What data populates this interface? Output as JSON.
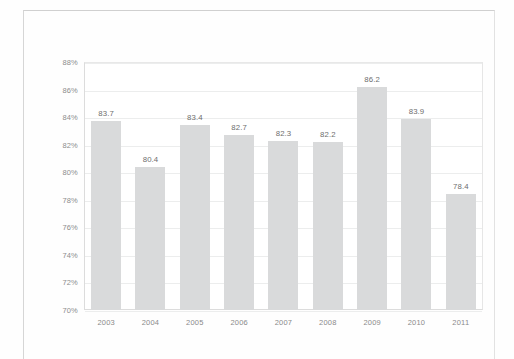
{
  "chart_data": {
    "type": "bar",
    "title": "",
    "subtitle": "",
    "xlabel": "",
    "ylabel": "",
    "categories": [
      "2003",
      "2004",
      "2005",
      "2006",
      "2007",
      "2008",
      "2009",
      "2010",
      "2011"
    ],
    "values": [
      83.7,
      80.4,
      83.4,
      82.7,
      82.3,
      82.2,
      86.2,
      83.9,
      78.4
    ],
    "value_labels": [
      "83.7",
      "80.4",
      "83.4",
      "82.7",
      "82.3",
      "82.2",
      "86.2",
      "83.9",
      "78.4"
    ],
    "ylim": [
      70,
      88
    ],
    "ytick_values": [
      88,
      86,
      84,
      82,
      80,
      78,
      76,
      74,
      72,
      70
    ],
    "ytick_labels": [
      "88%",
      "86%",
      "84%",
      "82%",
      "80%",
      "78%",
      "76%",
      "74%",
      "72%",
      "70%"
    ],
    "grid": true,
    "legend": null,
    "legend_position": "none",
    "bar_color": "#d9dadb",
    "gridline_color": "#eceded",
    "axis_color": "#dcdcdc",
    "tick_label_color": "#8d8d8d",
    "value_label_color": "#6e6e6e"
  }
}
